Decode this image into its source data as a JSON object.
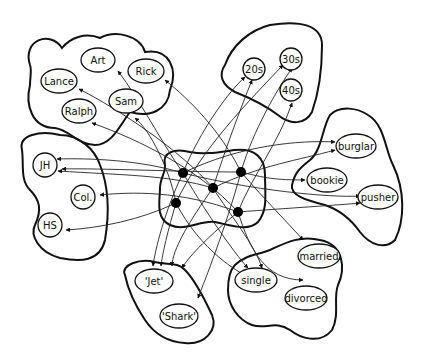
{
  "diagram": {
    "type": "network",
    "hub_count": 5,
    "groups": [
      {
        "name": "names",
        "units": [
          "Art",
          "Rick",
          "Lance",
          "Sam",
          "Ralph"
        ]
      },
      {
        "name": "ages",
        "units": [
          "20s",
          "30s",
          "40s"
        ]
      },
      {
        "name": "education",
        "units": [
          "JH",
          "Col.",
          "HS"
        ]
      },
      {
        "name": "occupation",
        "units": [
          "burglar",
          "bookie",
          "pusher"
        ]
      },
      {
        "name": "gang",
        "units": [
          "'Jet'",
          "'Shark'"
        ]
      },
      {
        "name": "marital",
        "units": [
          "married",
          "single",
          "divorced"
        ]
      }
    ]
  },
  "labels": {
    "art": "Art",
    "rick": "Rick",
    "lance": "Lance",
    "sam": "Sam",
    "ralph": "Ralph",
    "a20": "20s",
    "a30": "30s",
    "a40": "40s",
    "jh": "JH",
    "col": "Col.",
    "hs": "HS",
    "burglar": "burglar",
    "bookie": "bookie",
    "pusher": "pusher",
    "jet": "'Jet'",
    "shark": "'Shark'",
    "married": "married",
    "single": "single",
    "divorced": "divorced"
  }
}
